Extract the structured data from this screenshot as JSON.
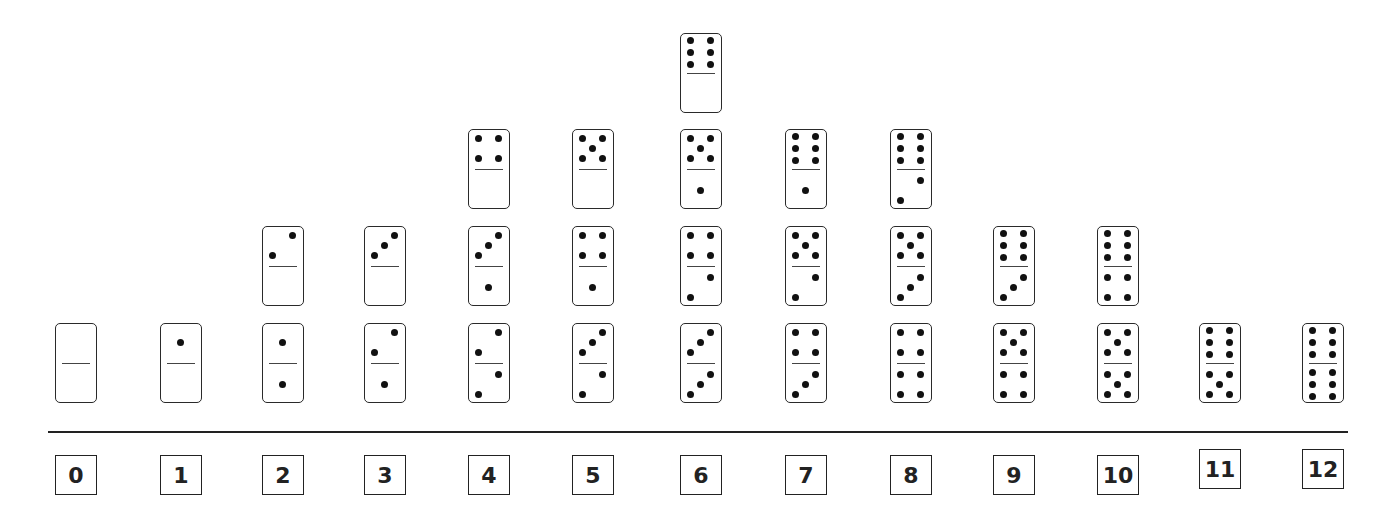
{
  "colors": {
    "ink": "#222222",
    "pip": "#111111",
    "background": "#ffffff"
  },
  "columns": [
    {
      "sum": "0",
      "dominoes": [
        [
          0,
          0
        ]
      ]
    },
    {
      "sum": "1",
      "dominoes": [
        [
          1,
          0
        ]
      ]
    },
    {
      "sum": "2",
      "dominoes": [
        [
          1,
          1
        ],
        [
          2,
          0
        ]
      ]
    },
    {
      "sum": "3",
      "dominoes": [
        [
          2,
          1
        ],
        [
          3,
          0
        ]
      ]
    },
    {
      "sum": "4",
      "dominoes": [
        [
          2,
          2
        ],
        [
          3,
          1
        ],
        [
          4,
          0
        ]
      ]
    },
    {
      "sum": "5",
      "dominoes": [
        [
          3,
          2
        ],
        [
          4,
          1
        ],
        [
          5,
          0
        ]
      ]
    },
    {
      "sum": "6",
      "dominoes": [
        [
          3,
          3
        ],
        [
          4,
          2
        ],
        [
          5,
          1
        ],
        [
          6,
          0
        ]
      ]
    },
    {
      "sum": "7",
      "dominoes": [
        [
          4,
          3
        ],
        [
          5,
          2
        ],
        [
          6,
          1
        ]
      ]
    },
    {
      "sum": "8",
      "dominoes": [
        [
          4,
          4
        ],
        [
          5,
          3
        ],
        [
          6,
          2
        ]
      ]
    },
    {
      "sum": "9",
      "dominoes": [
        [
          5,
          4
        ],
        [
          6,
          3
        ]
      ]
    },
    {
      "sum": "10",
      "dominoes": [
        [
          5,
          5
        ],
        [
          6,
          4
        ]
      ]
    },
    {
      "sum": "11",
      "dominoes": [
        [
          6,
          5
        ]
      ]
    },
    {
      "sum": "12",
      "dominoes": [
        [
          6,
          6
        ]
      ]
    }
  ],
  "chart_data": {
    "type": "bar",
    "title": "",
    "xlabel": "",
    "ylabel": "",
    "categories": [
      "0",
      "1",
      "2",
      "3",
      "4",
      "5",
      "6",
      "7",
      "8",
      "9",
      "10",
      "11",
      "12"
    ],
    "values": [
      1,
      1,
      2,
      2,
      3,
      3,
      4,
      3,
      3,
      2,
      2,
      1,
      1
    ],
    "representation": "stacked domino pictograph (each domino = 1)",
    "grid": false,
    "legend": null
  }
}
